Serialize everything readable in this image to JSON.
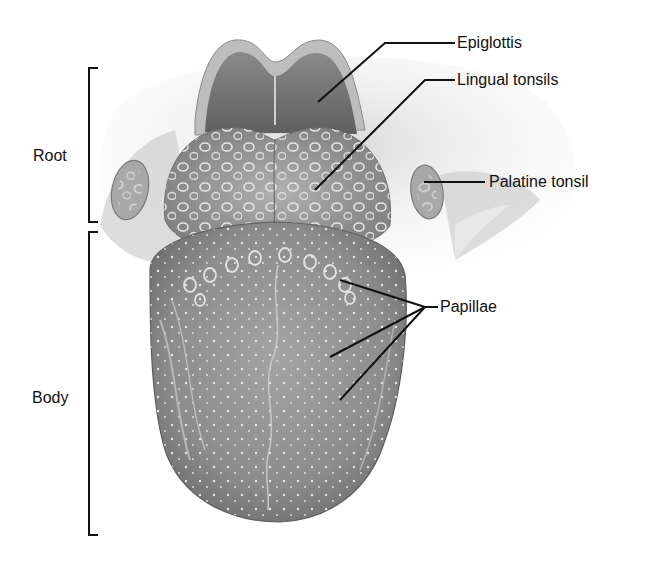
{
  "diagram": {
    "labels": {
      "epiglottis": "Epiglottis",
      "lingual_tonsils": "Lingual tonsils",
      "palatine_tonsil": "Palatine tonsil",
      "papillae": "Papillae",
      "root": "Root",
      "body": "Body"
    },
    "colors": {
      "line": "#111111",
      "tissue_dark": "#7a7a7a",
      "tissue_mid": "#9b9b9b",
      "tissue_light": "#c9c9c9",
      "background": "#ffffff"
    }
  }
}
